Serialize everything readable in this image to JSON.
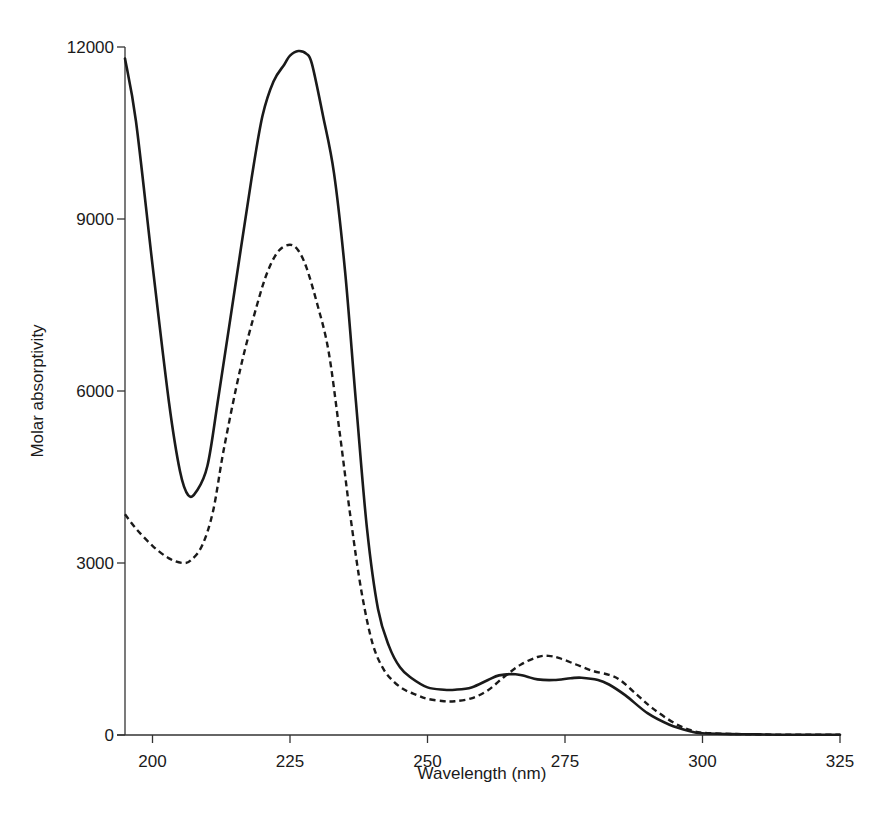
{
  "chart_data": {
    "type": "line",
    "title": "",
    "xlabel": "Wavelength (nm)",
    "ylabel": "Molar absorptivity",
    "xlim": [
      195,
      325
    ],
    "ylim": [
      0,
      12000
    ],
    "xticks": [
      200,
      225,
      250,
      275,
      300,
      325
    ],
    "yticks": [
      0,
      3000,
      6000,
      9000,
      12000
    ],
    "grid": false,
    "legend": null,
    "series": [
      {
        "name": "solid",
        "style": "solid",
        "color": "#1a1a1a",
        "x": [
          195,
          197,
          200,
          203,
          205,
          206.5,
          208,
          210,
          212,
          215,
          218,
          220,
          222,
          224,
          225,
          226.5,
          228,
          229,
          231,
          233,
          235,
          237,
          239,
          241,
          243,
          245,
          247,
          250,
          253,
          255,
          258,
          261,
          263,
          266,
          268,
          270,
          273,
          276,
          278,
          281,
          283,
          286,
          290,
          294,
          298,
          300,
          305,
          310,
          315,
          320,
          325
        ],
        "values": [
          11800,
          10700,
          8200,
          5800,
          4600,
          4180,
          4250,
          4700,
          5900,
          7800,
          9700,
          10800,
          11400,
          11700,
          11850,
          11930,
          11880,
          11700,
          10800,
          9800,
          8100,
          5800,
          3600,
          2200,
          1550,
          1180,
          1000,
          830,
          790,
          790,
          830,
          960,
          1040,
          1060,
          1020,
          970,
          960,
          990,
          1000,
          960,
          880,
          690,
          380,
          180,
          60,
          30,
          15,
          10,
          5,
          5,
          5
        ]
      },
      {
        "name": "dashed",
        "style": "dashed",
        "color": "#1a1a1a",
        "x": [
          195,
          197,
          200,
          203,
          205.5,
          207,
          209,
          211,
          213,
          216,
          219,
          221,
          223,
          225,
          226.5,
          228,
          230,
          232,
          234,
          236,
          238,
          240,
          242,
          244,
          246,
          248,
          250,
          253,
          255,
          258,
          261,
          264,
          267,
          270,
          272,
          274,
          277,
          280,
          283,
          285,
          288,
          291,
          295,
          298,
          300,
          305,
          310,
          315,
          320,
          325
        ],
        "values": [
          3850,
          3600,
          3300,
          3080,
          3000,
          3050,
          3300,
          3900,
          5000,
          6400,
          7500,
          8100,
          8450,
          8550,
          8450,
          8150,
          7500,
          6700,
          5300,
          3800,
          2500,
          1600,
          1150,
          920,
          780,
          700,
          630,
          590,
          590,
          640,
          780,
          1020,
          1230,
          1360,
          1380,
          1340,
          1230,
          1120,
          1050,
          960,
          710,
          460,
          200,
          80,
          40,
          20,
          10,
          5,
          5,
          5
        ]
      }
    ]
  },
  "axes": {
    "x_title": "Wavelength (nm)",
    "y_title": "Molar absorptivity",
    "x_tick_labels": [
      "200",
      "225",
      "250",
      "275",
      "300",
      "325"
    ],
    "y_tick_labels": [
      "0",
      "3000",
      "6000",
      "9000",
      "12000"
    ]
  }
}
